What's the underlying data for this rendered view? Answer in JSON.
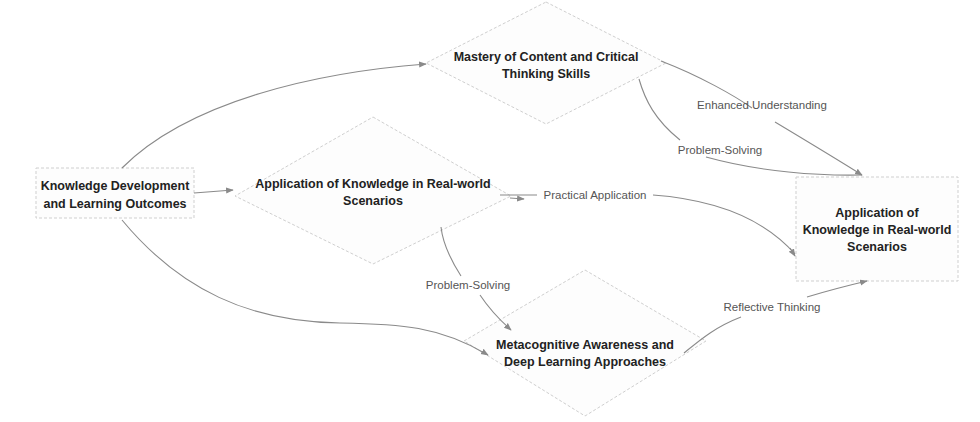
{
  "diagram": {
    "type": "flowchart",
    "colors": {
      "edge": "#8a8a8a",
      "node_border": "#cfcfcf",
      "node_fill": "#fdfdfd",
      "node_text": "#222222",
      "edge_text": "#555555"
    },
    "nodes": [
      {
        "id": "knowledge_dev",
        "shape": "rectangle",
        "lines": [
          "Knowledge Development",
          "and Learning Outcomes"
        ]
      },
      {
        "id": "mastery",
        "shape": "diamond",
        "lines": [
          "Mastery of Content and Critical",
          "Thinking Skills"
        ]
      },
      {
        "id": "application_mid",
        "shape": "diamond",
        "lines": [
          "Application of Knowledge in Real-world",
          "Scenarios"
        ]
      },
      {
        "id": "metacognitive",
        "shape": "diamond",
        "lines": [
          "Metacognitive Awareness and",
          "Deep Learning Approaches"
        ]
      },
      {
        "id": "application_right",
        "shape": "rectangle",
        "lines": [
          "Application of",
          "Knowledge in Real-world",
          "Scenarios"
        ]
      }
    ],
    "edges": [
      {
        "from": "knowledge_dev",
        "to": "mastery",
        "label": ""
      },
      {
        "from": "knowledge_dev",
        "to": "application_mid",
        "label": ""
      },
      {
        "from": "knowledge_dev",
        "to": "metacognitive",
        "label": ""
      },
      {
        "from": "mastery",
        "to": "application_right",
        "label": "Enhanced Understanding"
      },
      {
        "from": "mastery",
        "to": "application_right",
        "label": "Problem-Solving"
      },
      {
        "from": "application_mid",
        "to": "application_right",
        "label": "Practical Application"
      },
      {
        "from": "application_mid",
        "to": "metacognitive",
        "label": "Problem-Solving"
      },
      {
        "from": "metacognitive",
        "to": "application_right",
        "label": "Reflective Thinking"
      }
    ]
  }
}
